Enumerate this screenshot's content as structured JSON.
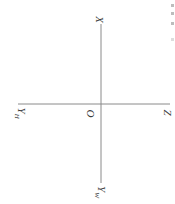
{
  "diagram": {
    "type": "projection-axes",
    "orientation": "rotated-90-clockwise",
    "line_color": "#8a8a8a",
    "label_color": "#3a3a3a",
    "labels": {
      "x": "X",
      "y_h": "Y",
      "y_h_sub": "H",
      "origin": "O",
      "z": "Z",
      "y_w": "Y",
      "y_w_sub": "W"
    },
    "axes": {
      "vertical": {
        "x": 101,
        "y1": 22,
        "y2": 183
      },
      "horizontal": {
        "y": 104,
        "x1": 18,
        "x2": 170
      }
    }
  }
}
